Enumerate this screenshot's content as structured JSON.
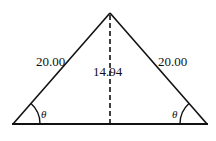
{
  "diagram": {
    "type": "isosceles-triangle",
    "left_side_label": "20.00",
    "right_side_label": "20.00",
    "height_label": "14.94",
    "left_angle_label": "θ",
    "right_angle_label": "θ",
    "line_color": "#111111"
  }
}
